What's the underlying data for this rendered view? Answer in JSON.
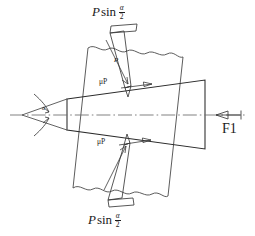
{
  "diagram": {
    "colors": {
      "line": "#2b2b2b",
      "thin_line": "#555555",
      "center_line": "#666666",
      "background": "#ffffff",
      "text": "#1b1b1b"
    },
    "labels": {
      "force_top": {
        "symbol": "P",
        "function": "sin",
        "numerator": "α",
        "denominator": "2"
      },
      "force_bottom": {
        "symbol": "P",
        "function": "sin",
        "numerator": "α",
        "denominator": "2"
      },
      "friction_top": "μP",
      "friction_bottom": "μP",
      "driving_force": "F1",
      "apex_angle": "α",
      "normal_force_top": "P",
      "normal_force_bottom": "P"
    },
    "parts": [
      "wedge-body",
      "plate-body",
      "center-line",
      "apex-angle-marks",
      "force-arrow-top",
      "force-arrow-bottom",
      "friction-arrow-top",
      "friction-arrow-bottom",
      "driving-force-arrow"
    ]
  }
}
